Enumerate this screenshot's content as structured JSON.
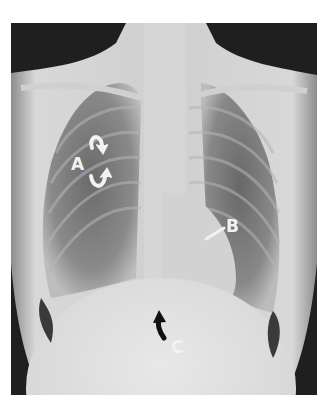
{
  "figure": {
    "type": "chest radiograph (PA view)",
    "annotations": [
      {
        "id": "A",
        "label": "A",
        "marker": "paired white curved arrows",
        "color": "#f2f2f2"
      },
      {
        "id": "B",
        "label": "B",
        "marker": "white straight arrow",
        "color": "#f2f2f2"
      },
      {
        "id": "C",
        "label": "C",
        "marker": "black curved arrow",
        "color": "#f2f2f2",
        "arrow_color": "#111111"
      }
    ]
  }
}
